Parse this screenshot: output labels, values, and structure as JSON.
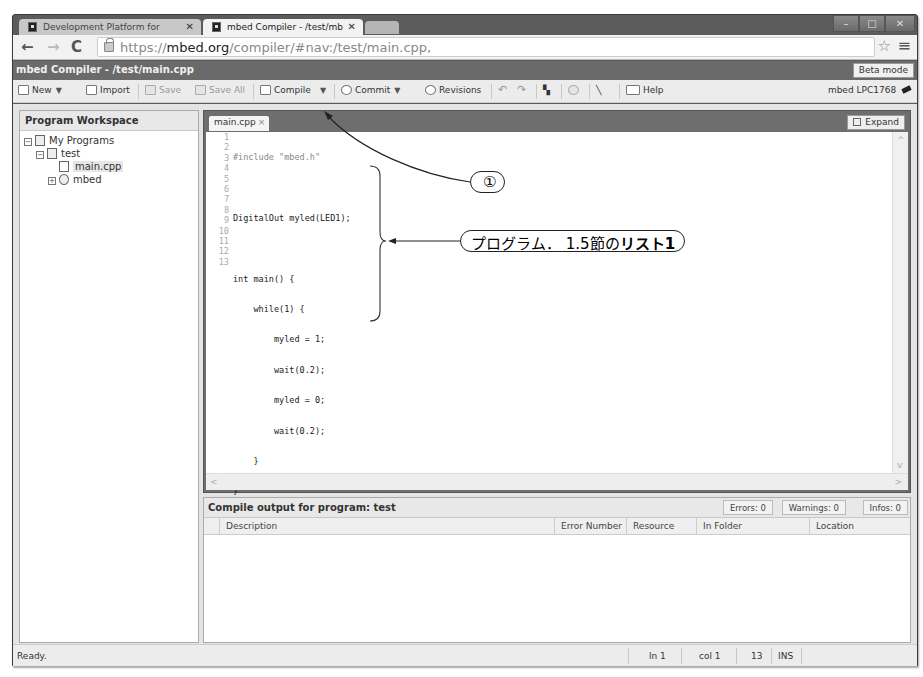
{
  "browser": {
    "tabs": [
      {
        "label": "Development Platform for",
        "active": false
      },
      {
        "label": "mbed Compiler - /test/mb",
        "active": true
      }
    ],
    "url": {
      "scheme": "https://",
      "host": "mbed.org",
      "path": "/compiler/#nav:/test/main.cpp,"
    },
    "window_controls": {
      "minimize": "–",
      "maximize": "□",
      "close": "✕"
    }
  },
  "app": {
    "title": "mbed Compiler - /test/main.cpp",
    "beta_mode_label": "Beta mode",
    "target_label": "mbed LPC1768"
  },
  "toolbar": {
    "new_label": "New",
    "import_label": "Import",
    "save_label": "Save",
    "save_all_label": "Save All",
    "compile_label": "Compile",
    "commit_label": "Commit",
    "revisions_label": "Revisions",
    "help_label": "Help"
  },
  "sidebar": {
    "title": "Program Workspace",
    "tree": [
      {
        "label": "My Programs",
        "level": 0,
        "expander": "⊟"
      },
      {
        "label": "test",
        "level": 1,
        "expander": "⊟"
      },
      {
        "label": "main.cpp",
        "level": 2,
        "selected": true
      },
      {
        "label": "mbed",
        "level": 1,
        "expander": "⊞"
      }
    ]
  },
  "editor": {
    "tab_label": "main.cpp",
    "tab_close": "×",
    "expand_label": "Expand",
    "line_numbers": [
      "1",
      "2",
      "3",
      "4",
      "5",
      "6",
      "7",
      "8",
      "9",
      "10",
      "11",
      "12",
      "13"
    ],
    "lines": [
      "#include \"mbed.h\"",
      "",
      "DigitalOut myled(LED1);",
      "",
      "int main() {",
      "    while(1) {",
      "        myled = 1;",
      "        wait(0.2);",
      "        myled = 0;",
      "        wait(0.2);",
      "    }",
      "}",
      ""
    ]
  },
  "output": {
    "title": "Compile output for program: test",
    "errors": "Errors: 0",
    "warnings": "Warnings: 0",
    "infos": "Infos: 0",
    "columns": [
      "Description",
      "Error Number",
      "Resource",
      "In Folder",
      "Location"
    ]
  },
  "status": {
    "message": "Ready.",
    "line": "ln 1",
    "col": "col 1",
    "count": "13",
    "mode": "INS"
  },
  "annotations": {
    "callout_1": "①",
    "callout_2_prefix": "プログラム． 1.5節の",
    "callout_2_bold": "リスト1"
  }
}
